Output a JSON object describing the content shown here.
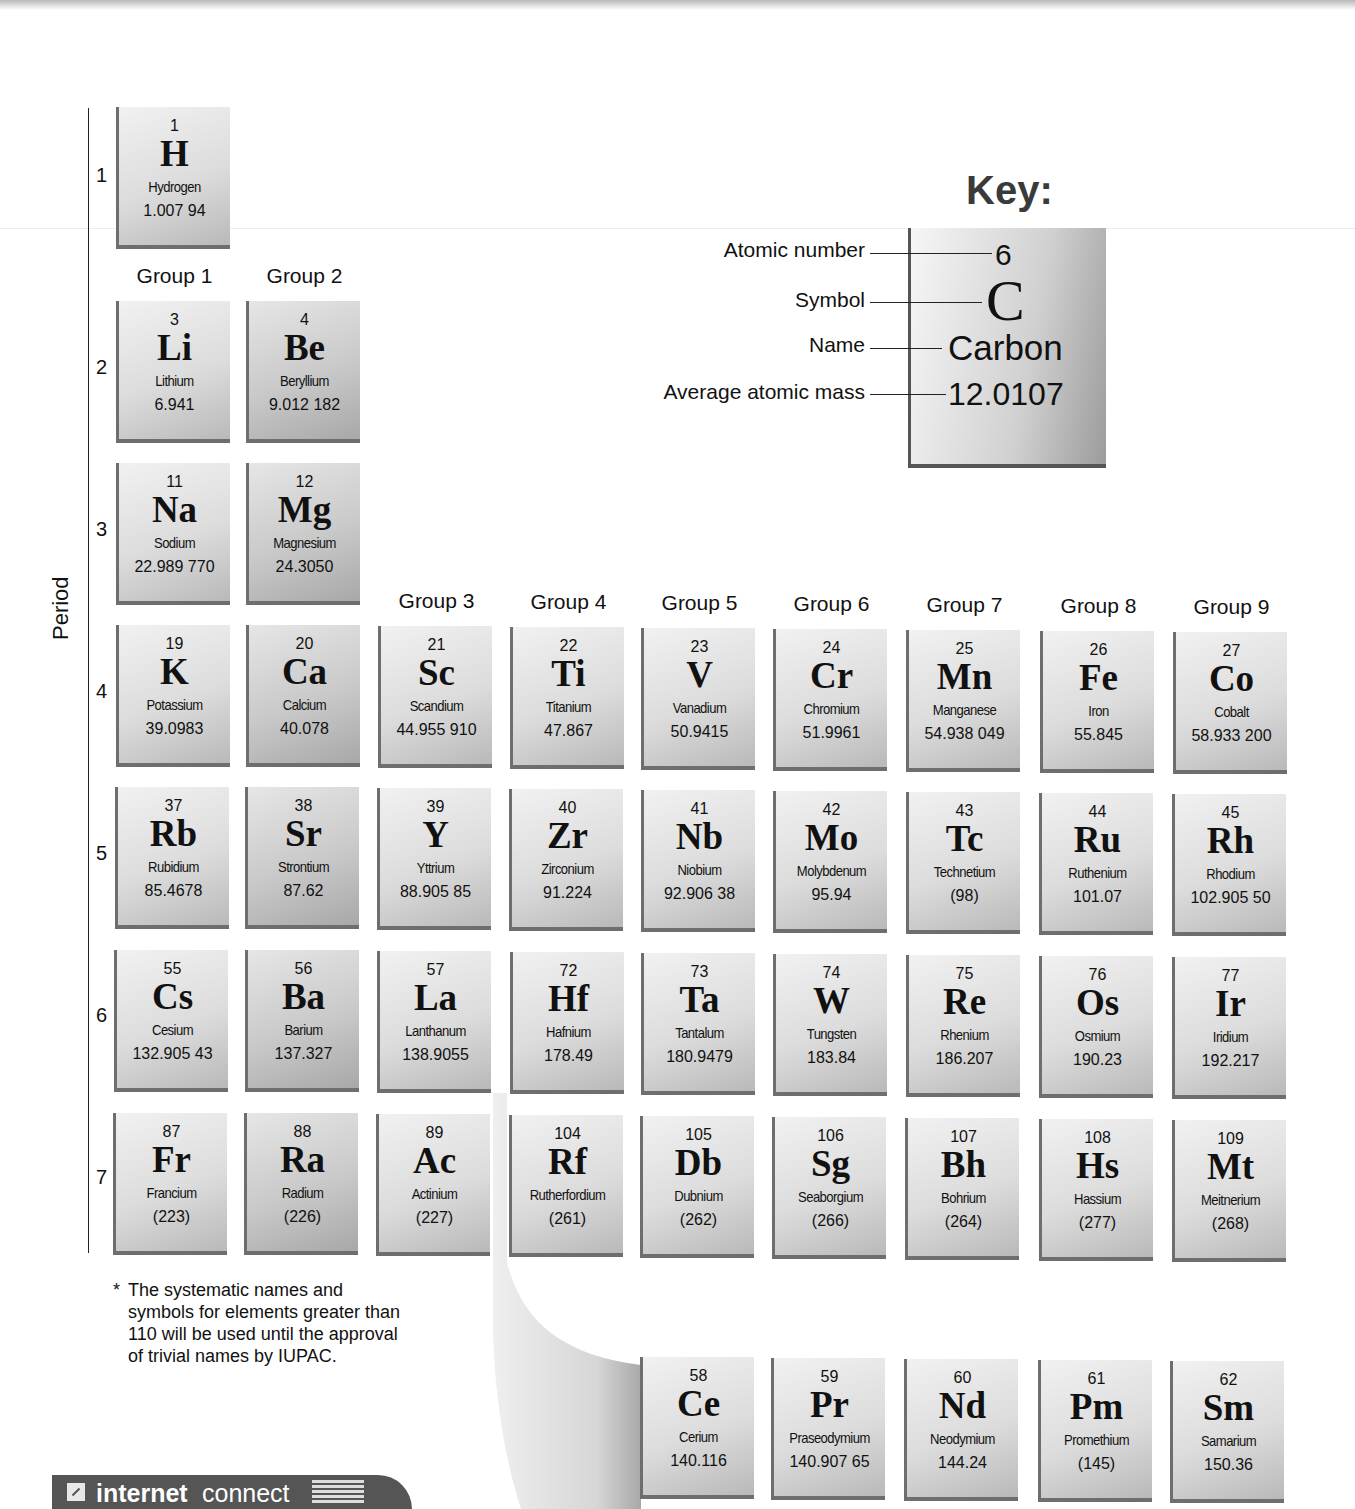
{
  "period_axis": {
    "title": "Period",
    "numbers": [
      "1",
      "2",
      "3",
      "4",
      "5",
      "6",
      "7"
    ]
  },
  "group_labels": [
    "Group 1",
    "Group 2",
    "Group 3",
    "Group 4",
    "Group 5",
    "Group 6",
    "Group 7",
    "Group 8",
    "Group 9"
  ],
  "key": {
    "title": "Key:",
    "labels": {
      "atomic_number": "Atomic number",
      "symbol": "Symbol",
      "name": "Name",
      "average_atomic_mass": "Average atomic mass"
    },
    "example": {
      "number": "6",
      "symbol": "C",
      "name": "Carbon",
      "mass": "12.0107"
    }
  },
  "elements": [
    {
      "n": "1",
      "s": "H",
      "name": "Hydrogen",
      "m": "1.007 94"
    },
    {
      "n": "3",
      "s": "Li",
      "name": "Lithium",
      "m": "6.941"
    },
    {
      "n": "4",
      "s": "Be",
      "name": "Beryllium",
      "m": "9.012 182"
    },
    {
      "n": "11",
      "s": "Na",
      "name": "Sodium",
      "m": "22.989 770"
    },
    {
      "n": "12",
      "s": "Mg",
      "name": "Magnesium",
      "m": "24.3050"
    },
    {
      "n": "19",
      "s": "K",
      "name": "Potassium",
      "m": "39.0983"
    },
    {
      "n": "20",
      "s": "Ca",
      "name": "Calcium",
      "m": "40.078"
    },
    {
      "n": "21",
      "s": "Sc",
      "name": "Scandium",
      "m": "44.955 910"
    },
    {
      "n": "22",
      "s": "Ti",
      "name": "Titanium",
      "m": "47.867"
    },
    {
      "n": "23",
      "s": "V",
      "name": "Vanadium",
      "m": "50.9415"
    },
    {
      "n": "24",
      "s": "Cr",
      "name": "Chromium",
      "m": "51.9961"
    },
    {
      "n": "25",
      "s": "Mn",
      "name": "Manganese",
      "m": "54.938 049"
    },
    {
      "n": "26",
      "s": "Fe",
      "name": "Iron",
      "m": "55.845"
    },
    {
      "n": "27",
      "s": "Co",
      "name": "Cobalt",
      "m": "58.933 200"
    },
    {
      "n": "37",
      "s": "Rb",
      "name": "Rubidium",
      "m": "85.4678"
    },
    {
      "n": "38",
      "s": "Sr",
      "name": "Strontium",
      "m": "87.62"
    },
    {
      "n": "39",
      "s": "Y",
      "name": "Yttrium",
      "m": "88.905 85"
    },
    {
      "n": "40",
      "s": "Zr",
      "name": "Zirconium",
      "m": "91.224"
    },
    {
      "n": "41",
      "s": "Nb",
      "name": "Niobium",
      "m": "92.906 38"
    },
    {
      "n": "42",
      "s": "Mo",
      "name": "Molybdenum",
      "m": "95.94"
    },
    {
      "n": "43",
      "s": "Tc",
      "name": "Technetium",
      "m": "(98)"
    },
    {
      "n": "44",
      "s": "Ru",
      "name": "Ruthenium",
      "m": "101.07"
    },
    {
      "n": "45",
      "s": "Rh",
      "name": "Rhodium",
      "m": "102.905 50"
    },
    {
      "n": "55",
      "s": "Cs",
      "name": "Cesium",
      "m": "132.905 43"
    },
    {
      "n": "56",
      "s": "Ba",
      "name": "Barium",
      "m": "137.327"
    },
    {
      "n": "57",
      "s": "La",
      "name": "Lanthanum",
      "m": "138.9055"
    },
    {
      "n": "72",
      "s": "Hf",
      "name": "Hafnium",
      "m": "178.49"
    },
    {
      "n": "73",
      "s": "Ta",
      "name": "Tantalum",
      "m": "180.9479"
    },
    {
      "n": "74",
      "s": "W",
      "name": "Tungsten",
      "m": "183.84"
    },
    {
      "n": "75",
      "s": "Re",
      "name": "Rhenium",
      "m": "186.207"
    },
    {
      "n": "76",
      "s": "Os",
      "name": "Osmium",
      "m": "190.23"
    },
    {
      "n": "77",
      "s": "Ir",
      "name": "Iridium",
      "m": "192.217"
    },
    {
      "n": "87",
      "s": "Fr",
      "name": "Francium",
      "m": "(223)"
    },
    {
      "n": "88",
      "s": "Ra",
      "name": "Radium",
      "m": "(226)"
    },
    {
      "n": "89",
      "s": "Ac",
      "name": "Actinium",
      "m": "(227)"
    },
    {
      "n": "104",
      "s": "Rf",
      "name": "Rutherfordium",
      "m": "(261)"
    },
    {
      "n": "105",
      "s": "Db",
      "name": "Dubnium",
      "m": "(262)"
    },
    {
      "n": "106",
      "s": "Sg",
      "name": "Seaborgium",
      "m": "(266)"
    },
    {
      "n": "107",
      "s": "Bh",
      "name": "Bohrium",
      "m": "(264)"
    },
    {
      "n": "108",
      "s": "Hs",
      "name": "Hassium",
      "m": "(277)"
    },
    {
      "n": "109",
      "s": "Mt",
      "name": "Meitnerium",
      "m": "(268)"
    },
    {
      "n": "58",
      "s": "Ce",
      "name": "Cerium",
      "m": "140.116"
    },
    {
      "n": "59",
      "s": "Pr",
      "name": "Praseodymium",
      "m": "140.907 65"
    },
    {
      "n": "60",
      "s": "Nd",
      "name": "Neodymium",
      "m": "144.24"
    },
    {
      "n": "61",
      "s": "Pm",
      "name": "Promethium",
      "m": "(145)"
    },
    {
      "n": "62",
      "s": "Sm",
      "name": "Samarium",
      "m": "150.36"
    }
  ],
  "footnote": {
    "marker": "*",
    "text": "The systematic names and symbols for elements greater than 110 will be used until the approval of trivial names by IUPAC."
  },
  "internet_connect": {
    "bold": "internet",
    "regular": "connect"
  }
}
